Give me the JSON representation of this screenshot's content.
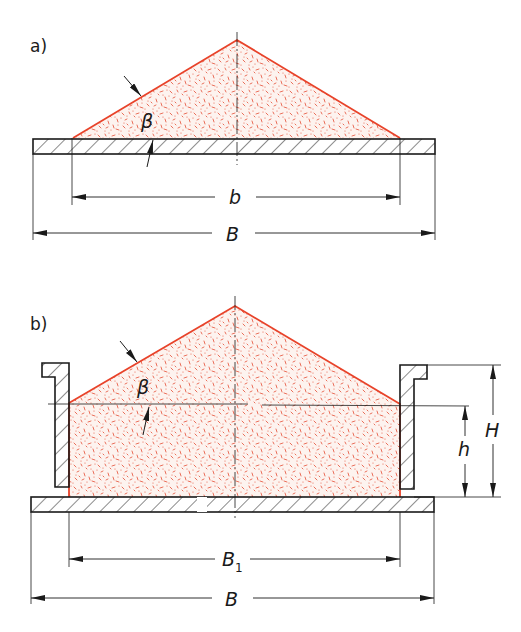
{
  "figure": {
    "panels": [
      {
        "id": "a",
        "label": "a)",
        "description": "Conical heap of bulk material on a flat plate",
        "angle_label": "β",
        "dimensions": [
          {
            "name": "b",
            "label": "b"
          },
          {
            "name": "B",
            "label": "B"
          }
        ]
      },
      {
        "id": "b",
        "label": "b)",
        "description": "Bulk material heaped in a container with side walls on a plate",
        "angle_label": "β",
        "dimensions": [
          {
            "name": "B1",
            "label": "B",
            "subscript": "1"
          },
          {
            "name": "B",
            "label": "B"
          },
          {
            "name": "h",
            "label": "h"
          },
          {
            "name": "H",
            "label": "H"
          }
        ]
      }
    ],
    "colors": {
      "outline": "#1a1a1a",
      "material_edge": "#e8432a",
      "material_fill": "#e8604a",
      "background": "#ffffff"
    }
  }
}
